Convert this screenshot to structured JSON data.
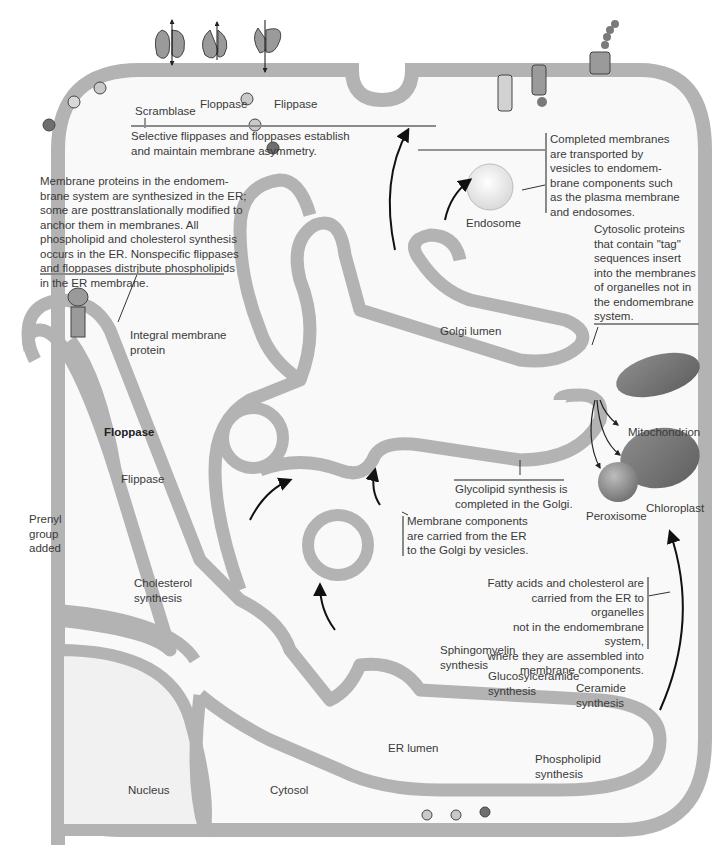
{
  "figure": {
    "colors": {
      "membrane": "#b3b3b3",
      "cytosol_fill": "#f7f7f7",
      "protein": "#9a9a9a",
      "protein_light": "#d2d2d2",
      "dark_head": "#6e6e6e",
      "organelle": "#7a7a7a",
      "text": "#3a3a3a"
    },
    "top_proteins": {
      "scramblase": "Scramblase",
      "floppase": "Floppase",
      "flippase": "Flippase"
    },
    "notes": {
      "asymmetry": "Selective flippases and floppases establish\nand maintain membrane asymmetry.",
      "er_synthesis": "Membrane proteins in the endomem-\nbrane system are synthesized in the ER;\nsome are posttranslationally modified to\nanchor them in membranes. All\nphospholipid and cholesterol synthesis\noccurs in the ER. Nonspecific flippases\nand floppases distribute phospholipids\nin the ER membrane.",
      "completed_membranes": "Completed membranes\nare transported by\nvesicles to endomem-\nbrane components such\nas the plasma membrane\nand endosomes.",
      "cytosolic_proteins": "Cytosolic proteins\nthat contain \"tag\"\nsequences insert\ninto the membranes\nof organelles not in\nthe endomembrane\nsystem.",
      "glycolipid": "Glycolipid synthesis is\ncompleted in the Golgi.",
      "er_to_golgi": "Membrane components\nare carried from the ER\nto the Golgi by vesicles.",
      "fatty_acids": "Fatty acids and cholesterol are\ncarried from the ER to organelles\nnot in the endomembrane system,\nwhere they are assembled into\nmembrane components."
    },
    "labels": {
      "endosome": "Endosome",
      "golgi_lumen": "Golgi lumen",
      "integral_membrane_protein": "Integral membrane\nprotein",
      "floppase_er": "Floppase",
      "flippase_er": "Flippase",
      "prenyl": "Prenyl\ngroup\nadded",
      "cholesterol": "Cholesterol\nsynthesis",
      "mitochondrion": "Mitochondrion",
      "chloroplast": "Chloroplast",
      "peroxisome": "Peroxisome",
      "sphingomyelin": "Sphingomyelin\nsynthesis",
      "glucosylceramide": "Glucosylceramide\nsynthesis",
      "ceramide": "Ceramide\nsynthesis",
      "er_lumen": "ER lumen",
      "phospholipid": "Phospholipid\nsynthesis",
      "nucleus": "Nucleus",
      "cytosol": "Cytosol"
    }
  }
}
